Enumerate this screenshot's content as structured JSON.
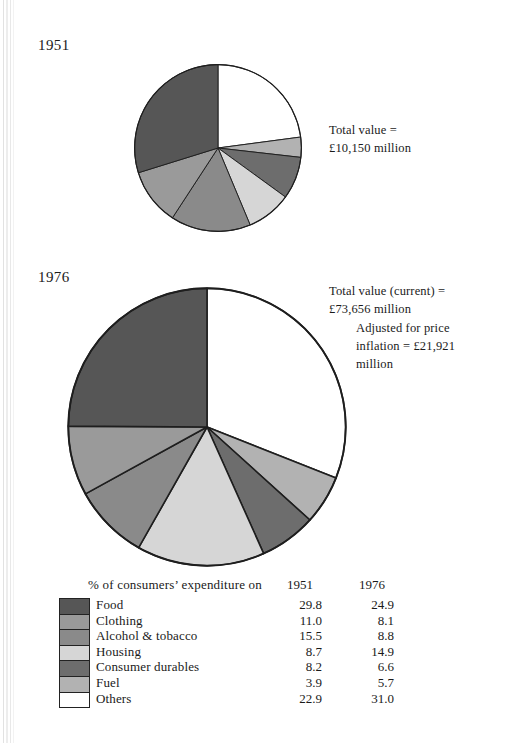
{
  "figure": {
    "panels": [
      {
        "year_label": "1951"
      },
      {
        "year_label": "1976"
      }
    ],
    "annotations": {
      "note_1951": "Total value =\n£10,150 million",
      "note_1976_current": "Total value (current) =\n£73,656 million",
      "note_1976_adjusted": "Adjusted for price\ninflation = £21,921\nmillion"
    }
  },
  "legend": {
    "title": "% of consumers’ expenditure on",
    "column_1951": "1951",
    "column_1976": "1976"
  },
  "chart_data": {
    "type": "pie",
    "title": "% of consumers’ expenditure on",
    "categories": [
      "Food",
      "Clothing",
      "Alcohol & tobacco",
      "Housing",
      "Consumer durables",
      "Fuel",
      "Others"
    ],
    "colors": [
      "#565656",
      "#9a9a9a",
      "#8a8a8a",
      "#d6d6d6",
      "#6d6d6d",
      "#b2b2b2",
      "#ffffff"
    ],
    "series": [
      {
        "name": "1951",
        "total_value_label": "Total value = £10,150 million",
        "total_value": 10150,
        "units": "£ million",
        "values": [
          29.8,
          11.0,
          15.5,
          8.7,
          8.2,
          3.9,
          22.9
        ]
      },
      {
        "name": "1976",
        "total_value_label": "Total value (current) = £73,656 million",
        "total_value": 73656,
        "adjusted_value_label": "Adjusted for price inflation = £21,921 million",
        "adjusted_value": 21921,
        "units": "£ million",
        "values": [
          24.9,
          8.1,
          8.8,
          14.9,
          6.6,
          5.7,
          31.0
        ]
      }
    ],
    "ylabel": "",
    "xlabel": "",
    "legend_position": "bottom",
    "grid": false,
    "slice_order_note": "Drawn clockwise from 12 o'clock: Others, Fuel, Consumer durables, Housing, Alcohol & tobacco, Clothing, Food"
  }
}
